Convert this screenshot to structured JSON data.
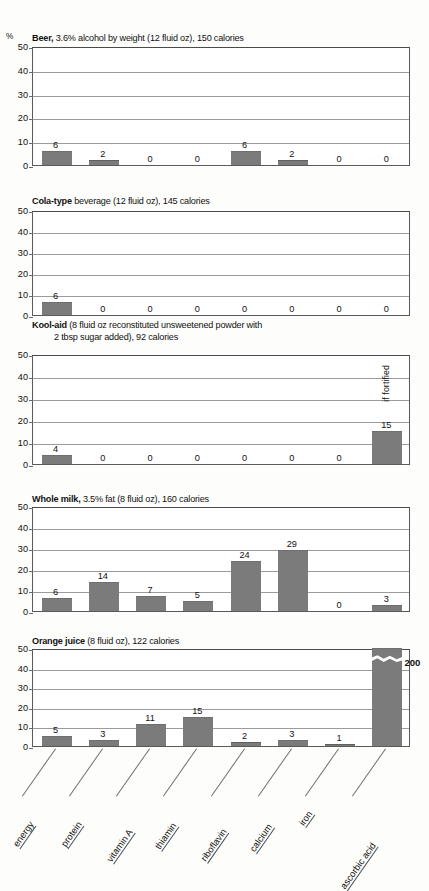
{
  "figure": {
    "axis_unit": "%",
    "y_ticks": [
      "50",
      "40",
      "30",
      "20",
      "10",
      "0"
    ],
    "bar_color": "#7b7b7b",
    "categories": [
      "energy",
      "protein",
      "vitamin A",
      "thiamin",
      "riboflavin",
      "calcium",
      "iron",
      "ascorbic acid"
    ]
  },
  "charts": [
    {
      "title_bold": "Beer,",
      "title_rest": " 3.6% alcohol by weight (12 fluid oz), 150 calories",
      "title_line2": "",
      "values": [
        6,
        2,
        0,
        0,
        6,
        2,
        0,
        0
      ],
      "labels": [
        "6",
        "2",
        "0",
        "0",
        "6",
        "2",
        "0",
        "0"
      ],
      "note": ""
    },
    {
      "title_bold": "Cola-type",
      "title_rest": " beverage (12 fluid oz), 145 calories",
      "title_line2": "",
      "values": [
        6,
        0,
        0,
        0,
        0,
        0,
        0,
        0
      ],
      "labels": [
        "6",
        "0",
        "0",
        "0",
        "0",
        "0",
        "0",
        "0"
      ],
      "note": ""
    },
    {
      "title_bold": "Kool-aid",
      "title_rest": " (8 fluid oz reconstituted unsweetened powder with",
      "title_line2": "2 tbsp sugar added), 92 calories",
      "values": [
        4,
        0,
        0,
        0,
        0,
        0,
        0,
        15
      ],
      "labels": [
        "4",
        "0",
        "0",
        "0",
        "0",
        "0",
        "0",
        "15"
      ],
      "note": "if fortified"
    },
    {
      "title_bold": "Whole milk,",
      "title_rest": " 3.5% fat (8 fluid oz), 160 calories",
      "title_line2": "",
      "values": [
        6,
        14,
        7,
        5,
        24,
        29,
        0,
        3
      ],
      "labels": [
        "6",
        "14",
        "7",
        "5",
        "24",
        "29",
        "0",
        "3"
      ],
      "note": ""
    },
    {
      "title_bold": "Orange juice",
      "title_rest": " (8 fluid oz), 122 calories",
      "title_line2": "",
      "values": [
        5,
        3,
        11,
        15,
        2,
        3,
        1,
        200
      ],
      "labels": [
        "5",
        "3",
        "11",
        "15",
        "2",
        "3",
        "1",
        "200"
      ],
      "note": "",
      "broken_bar_index": 7,
      "broken_bar_label": "200"
    }
  ],
  "chart_data": {
    "type": "bar",
    "xlabel": "",
    "ylabel": "%",
    "ylim": [
      0,
      50
    ],
    "grid": true,
    "legend": "none",
    "categories": [
      "energy",
      "protein",
      "vitamin A",
      "thiamin",
      "riboflavin",
      "calcium",
      "iron",
      "ascorbic acid"
    ],
    "series": [
      {
        "name": "Beer, 3.6% alcohol by weight (12 fluid oz), 150 calories",
        "values": [
          6,
          2,
          0,
          0,
          6,
          2,
          0,
          0
        ]
      },
      {
        "name": "Cola-type beverage (12 fluid oz), 145 calories",
        "values": [
          6,
          0,
          0,
          0,
          0,
          0,
          0,
          0
        ]
      },
      {
        "name": "Kool-aid (8 fluid oz reconstituted unsweetened powder with 2 tbsp sugar added), 92 calories",
        "values": [
          4,
          0,
          0,
          0,
          0,
          0,
          0,
          15
        ]
      },
      {
        "name": "Whole milk, 3.5% fat (8 fluid oz), 160 calories",
        "values": [
          6,
          14,
          7,
          5,
          24,
          29,
          0,
          3
        ]
      },
      {
        "name": "Orange juice (8 fluid oz), 122 calories",
        "values": [
          5,
          3,
          11,
          15,
          2,
          3,
          1,
          200
        ]
      }
    ],
    "annotations": [
      {
        "chart": "Kool-aid",
        "category": "ascorbic acid",
        "text": "if fortified"
      },
      {
        "chart": "Orange juice",
        "category": "ascorbic acid",
        "text": "200",
        "note": "bar axis-broken; exceeds 50% scale"
      }
    ]
  }
}
